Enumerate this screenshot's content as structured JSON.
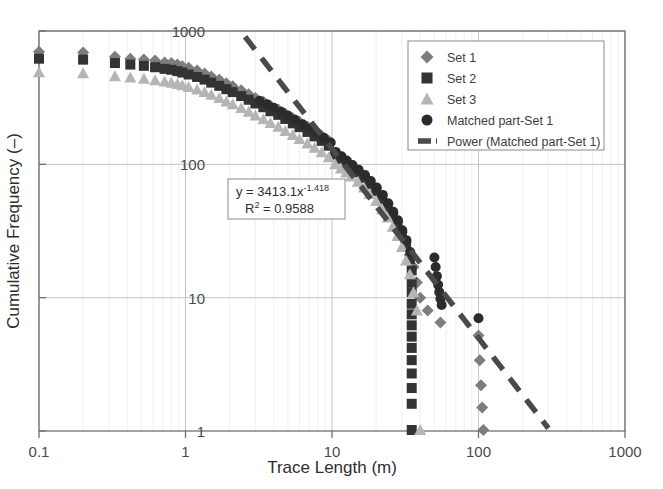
{
  "chart_data": {
    "type": "scatter",
    "title": "",
    "xlabel": "Trace Length (m)",
    "ylabel": "Cumulative Frequency (–)",
    "xscale": "log",
    "yscale": "log",
    "xlim": [
      0.1,
      1000
    ],
    "ylim": [
      1,
      1000
    ],
    "xticks": [
      "0.1",
      "1",
      "10",
      "100",
      "1000"
    ],
    "yticks": [
      "1",
      "10",
      "100",
      "1000"
    ],
    "grid": "major horizontal and vertical, minor vertical",
    "legend_position": "top-right inside plot",
    "annotation": {
      "equation_main": "y = 3413.1x",
      "equation_exponent": "-1.418",
      "r_squared_label": "R",
      "r_squared_sup": "2",
      "r_squared_value": " = 0.9588"
    },
    "series": [
      {
        "name": "Set 1",
        "marker": "diamond",
        "color": "#7d7d7d",
        "points": [
          [
            0.1,
            700
          ],
          [
            0.2,
            690
          ],
          [
            0.33,
            640
          ],
          [
            0.42,
            620
          ],
          [
            0.52,
            610
          ],
          [
            0.62,
            600
          ],
          [
            0.72,
            580
          ],
          [
            0.8,
            575
          ],
          [
            0.88,
            560
          ],
          [
            0.95,
            545
          ],
          [
            1.05,
            530
          ],
          [
            1.2,
            505
          ],
          [
            1.35,
            480
          ],
          [
            1.5,
            455
          ],
          [
            1.7,
            430
          ],
          [
            1.9,
            405
          ],
          [
            2.1,
            385
          ],
          [
            2.4,
            360
          ],
          [
            2.7,
            335
          ],
          [
            3.0,
            315
          ],
          [
            3.4,
            295
          ],
          [
            3.8,
            275
          ],
          [
            4.3,
            258
          ],
          [
            4.8,
            240
          ],
          [
            5.4,
            222
          ],
          [
            6.0,
            208
          ],
          [
            6.8,
            192
          ],
          [
            7.6,
            178
          ],
          [
            8.5,
            164
          ],
          [
            9.5,
            150
          ],
          [
            10.5,
            122
          ],
          [
            11.5,
            113
          ],
          [
            12.5,
            105
          ],
          [
            13.5,
            98
          ],
          [
            15,
            90
          ],
          [
            16.5,
            82
          ],
          [
            18,
            74
          ],
          [
            20,
            66
          ],
          [
            22,
            58
          ],
          [
            24,
            50
          ],
          [
            26,
            43
          ],
          [
            28,
            37
          ],
          [
            30,
            31
          ],
          [
            32,
            26
          ],
          [
            34,
            21
          ],
          [
            36,
            17
          ],
          [
            38,
            13
          ],
          [
            40,
            10
          ],
          [
            45,
            8
          ],
          [
            55,
            6.5
          ],
          [
            100,
            5.2
          ],
          [
            102,
            3.4
          ],
          [
            104,
            2.2
          ],
          [
            106,
            1.5
          ],
          [
            108,
            1.0
          ]
        ]
      },
      {
        "name": "Set 2",
        "marker": "square",
        "color": "#333333",
        "points": [
          [
            0.1,
            620
          ],
          [
            0.2,
            610
          ],
          [
            0.33,
            575
          ],
          [
            0.42,
            560
          ],
          [
            0.52,
            548
          ],
          [
            0.62,
            535
          ],
          [
            0.72,
            520
          ],
          [
            0.8,
            512
          ],
          [
            0.88,
            500
          ],
          [
            0.95,
            488
          ],
          [
            1.05,
            472
          ],
          [
            1.2,
            452
          ],
          [
            1.35,
            432
          ],
          [
            1.5,
            410
          ],
          [
            1.7,
            388
          ],
          [
            1.9,
            366
          ],
          [
            2.1,
            348
          ],
          [
            2.4,
            325
          ],
          [
            2.7,
            305
          ],
          [
            3.0,
            286
          ],
          [
            3.4,
            268
          ],
          [
            3.8,
            250
          ],
          [
            4.3,
            235
          ],
          [
            4.8,
            219
          ],
          [
            5.4,
            203
          ],
          [
            6.0,
            190
          ],
          [
            6.8,
            175
          ],
          [
            7.6,
            162
          ],
          [
            8.5,
            150
          ],
          [
            9.5,
            138
          ],
          [
            10.5,
            118
          ],
          [
            11.5,
            110
          ],
          [
            12.5,
            102
          ],
          [
            13.5,
            95
          ],
          [
            15,
            87
          ],
          [
            16.5,
            79
          ],
          [
            18,
            71
          ],
          [
            20,
            63
          ],
          [
            22,
            55
          ],
          [
            24,
            48
          ],
          [
            26,
            41
          ],
          [
            28,
            35
          ],
          [
            30,
            29
          ],
          [
            32,
            24
          ],
          [
            34,
            19.5
          ],
          [
            35,
            16
          ],
          [
            35,
            13
          ],
          [
            35,
            11
          ],
          [
            35,
            9
          ],
          [
            35,
            7.5
          ],
          [
            35,
            6.2
          ],
          [
            35,
            5.1
          ],
          [
            35,
            4.2
          ],
          [
            35,
            3.4
          ],
          [
            35,
            2.7
          ],
          [
            35,
            2.1
          ],
          [
            35,
            1.6
          ],
          [
            35,
            1.0
          ]
        ]
      },
      {
        "name": "Set 3",
        "marker": "triangle",
        "color": "#b5b5b5",
        "points": [
          [
            0.1,
            490
          ],
          [
            0.2,
            482
          ],
          [
            0.33,
            458
          ],
          [
            0.42,
            448
          ],
          [
            0.52,
            438
          ],
          [
            0.62,
            428
          ],
          [
            0.72,
            418
          ],
          [
            0.8,
            410
          ],
          [
            0.88,
            400
          ],
          [
            0.95,
            392
          ],
          [
            1.05,
            380
          ],
          [
            1.2,
            364
          ],
          [
            1.35,
            348
          ],
          [
            1.5,
            332
          ],
          [
            1.7,
            314
          ],
          [
            1.9,
            296
          ],
          [
            2.1,
            282
          ],
          [
            2.4,
            264
          ],
          [
            2.7,
            248
          ],
          [
            3.0,
            232
          ],
          [
            3.4,
            218
          ],
          [
            3.8,
            204
          ],
          [
            4.3,
            191
          ],
          [
            4.8,
            178
          ],
          [
            5.4,
            166
          ],
          [
            6.0,
            155
          ],
          [
            6.8,
            143
          ],
          [
            7.6,
            133
          ],
          [
            8.5,
            123
          ],
          [
            9.5,
            113
          ],
          [
            10.5,
            100
          ],
          [
            11.5,
            93
          ],
          [
            12.5,
            87
          ],
          [
            13.5,
            81
          ],
          [
            15,
            74
          ],
          [
            16.5,
            67
          ],
          [
            18,
            60
          ],
          [
            20,
            53
          ],
          [
            22,
            46
          ],
          [
            24,
            40
          ],
          [
            26,
            34
          ],
          [
            28,
            29
          ],
          [
            30,
            24
          ],
          [
            32,
            19
          ],
          [
            34,
            15
          ],
          [
            36,
            11
          ],
          [
            38,
            8
          ],
          [
            40,
            1.0
          ]
        ]
      },
      {
        "name": "Matched part-Set 1",
        "marker": "circle",
        "color": "#2b2b2b",
        "points": [
          [
            3.2,
            300
          ],
          [
            3.6,
            282
          ],
          [
            4.0,
            266
          ],
          [
            4.5,
            248
          ],
          [
            5.0,
            232
          ],
          [
            5.6,
            216
          ],
          [
            6.3,
            200
          ],
          [
            7.0,
            186
          ],
          [
            7.9,
            172
          ],
          [
            8.8,
            158
          ],
          [
            9.8,
            146
          ],
          [
            10.6,
            124
          ],
          [
            11.6,
            115
          ],
          [
            12.6,
            107
          ],
          [
            13.8,
            99
          ],
          [
            15.2,
            91
          ],
          [
            16.8,
            83
          ],
          [
            18.4,
            75
          ],
          [
            20.2,
            67
          ],
          [
            22.2,
            59
          ],
          [
            24.2,
            51
          ],
          [
            26.2,
            44
          ],
          [
            28.2,
            38
          ],
          [
            30.2,
            32
          ],
          [
            32.2,
            27
          ],
          [
            34.2,
            22
          ],
          [
            50,
            20
          ],
          [
            51,
            17
          ],
          [
            52,
            14.5
          ],
          [
            53,
            12.5
          ],
          [
            54,
            11
          ],
          [
            55,
            9.8
          ],
          [
            56,
            8.8
          ],
          [
            100,
            7.0
          ]
        ]
      }
    ],
    "trendline": {
      "name": "Power (Matched part-Set 1)",
      "style": "dashed",
      "color": "#4a4a4a",
      "coefficient": 3413.1,
      "exponent": -1.418,
      "r_squared": 0.9588,
      "x_from": 2.55,
      "x_to": 300
    }
  },
  "legend": {
    "items": [
      {
        "label": "Set 1",
        "marker": "diamond",
        "color": "#7d7d7d"
      },
      {
        "label": "Set 2",
        "marker": "square",
        "color": "#333333"
      },
      {
        "label": "Set 3",
        "marker": "triangle",
        "color": "#b5b5b5"
      },
      {
        "label": "Matched part-Set 1",
        "marker": "circle",
        "color": "#2b2b2b"
      },
      {
        "label": "Power (Matched part-Set 1)",
        "marker": "dashed-line",
        "color": "#4a4a4a"
      }
    ]
  }
}
